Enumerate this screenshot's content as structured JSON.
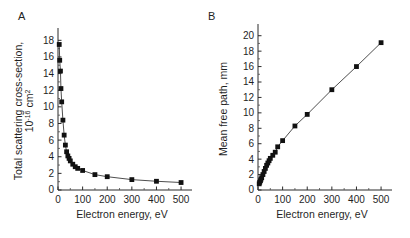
{
  "figure": {
    "background_color": "#ffffff",
    "line_color": "#3a3a3a",
    "marker_color": "#111111",
    "axis_color": "#2b2b2b"
  },
  "panels": {
    "a": {
      "letter": "A",
      "xlabel": "Electron energy, eV",
      "ylabel_line1": "Total scattering cross-section,",
      "ylabel_line2_base": "10",
      "ylabel_line2_exp": "-16",
      "ylabel_line2_unit": " cm",
      "ylabel_line2_unit_exp": "2",
      "x_ticks": [
        "0",
        "100",
        "200",
        "300",
        "400",
        "500"
      ],
      "y_ticks": [
        "0",
        "2",
        "4",
        "6",
        "8",
        "10",
        "12",
        "14",
        "16",
        "18"
      ]
    },
    "b": {
      "letter": "B",
      "xlabel": "Electron energy, eV",
      "ylabel": "Mean free path, mm",
      "x_ticks": [
        "0",
        "100",
        "200",
        "300",
        "400",
        "500"
      ],
      "y_ticks": [
        "0",
        "2",
        "4",
        "6",
        "8",
        "10",
        "12",
        "14",
        "16",
        "18",
        "20"
      ]
    }
  },
  "chart_data": [
    {
      "type": "line",
      "panel": "A",
      "title": "",
      "xlabel": "Electron energy, eV",
      "ylabel": "Total scattering cross-section, 10^-16 cm^2",
      "xlim": [
        0,
        520
      ],
      "ylim": [
        0,
        19
      ],
      "x_ticks": [
        0,
        100,
        200,
        300,
        400,
        500
      ],
      "y_ticks": [
        0,
        2,
        4,
        6,
        8,
        10,
        12,
        14,
        16,
        18
      ],
      "grid": false,
      "legend": "none",
      "marker": "square",
      "x": [
        5,
        7,
        10,
        12,
        15,
        20,
        25,
        30,
        35,
        40,
        45,
        50,
        60,
        70,
        80,
        100,
        150,
        200,
        300,
        400,
        500
      ],
      "y": [
        17.5,
        15.6,
        14.3,
        12.2,
        10.6,
        8.4,
        6.6,
        5.4,
        4.6,
        4.1,
        3.8,
        3.5,
        3.1,
        2.8,
        2.6,
        2.35,
        1.85,
        1.6,
        1.25,
        1.05,
        0.9
      ]
    },
    {
      "type": "line",
      "panel": "B",
      "title": "",
      "xlabel": "Electron energy, eV",
      "ylabel": "Mean free path, mm",
      "xlim": [
        0,
        520
      ],
      "ylim": [
        0,
        21
      ],
      "x_ticks": [
        0,
        100,
        200,
        300,
        400,
        500
      ],
      "y_ticks": [
        0,
        2,
        4,
        6,
        8,
        10,
        12,
        14,
        16,
        18,
        20
      ],
      "grid": false,
      "legend": "none",
      "marker": "square",
      "x": [
        5,
        7,
        10,
        12,
        15,
        20,
        25,
        30,
        35,
        40,
        45,
        50,
        60,
        70,
        80,
        100,
        150,
        200,
        300,
        400,
        500
      ],
      "y": [
        0.8,
        1.0,
        1.2,
        1.4,
        1.6,
        2.0,
        2.4,
        2.8,
        3.2,
        3.5,
        3.8,
        4.1,
        4.5,
        4.9,
        5.6,
        6.4,
        8.3,
        9.8,
        13.0,
        16.0,
        19.1
      ]
    }
  ]
}
